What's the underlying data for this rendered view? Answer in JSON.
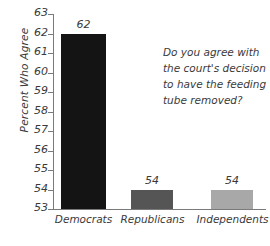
{
  "chart_data": {
    "type": "bar",
    "title": "",
    "subtitle": "",
    "xlabel": "",
    "ylabel": "Percent Who Agree",
    "ylim": [
      53,
      63
    ],
    "ytick_step": 1,
    "yticks": [
      "63",
      "62",
      "61",
      "60",
      "59",
      "58",
      "57",
      "56",
      "55",
      "54",
      "53"
    ],
    "grid": false,
    "legend": "none",
    "categories": [
      "Democrats",
      "Republicans",
      "Independents"
    ],
    "values": [
      62,
      54,
      54
    ],
    "value_labels": [
      "62",
      "54",
      "54"
    ],
    "bar_colors": [
      "#141414",
      "#555555",
      "#a8a8a8"
    ],
    "annotations": [
      {
        "name": "question-annotation",
        "lines": [
          "Do you agree with",
          "the court's decision",
          "to have the feeding",
          "tube removed?"
        ]
      }
    ]
  },
  "axis": {
    "y_title": "Percent Who Agree"
  }
}
